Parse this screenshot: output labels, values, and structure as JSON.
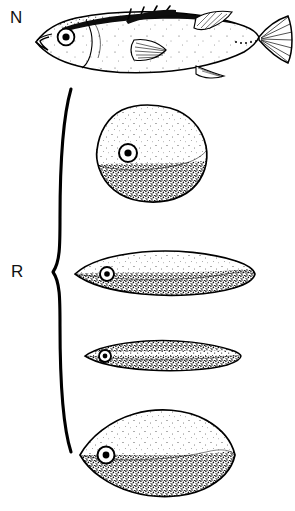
{
  "figure": {
    "background_color": "#ffffff",
    "ink_color": "#000000",
    "width": 295,
    "height": 511
  },
  "labels": {
    "normal": {
      "text": "N",
      "meaning": "normal-form",
      "x": 10,
      "y": 9
    },
    "radiated": {
      "text": "R",
      "meaning": "radiated-form-group",
      "x": 11,
      "y": 263
    }
  },
  "brace": {
    "name": "curly-brace",
    "orientation": "left-facing",
    "top_y": 88,
    "apex_y": 272,
    "bottom_y": 452,
    "x": 62
  },
  "specimens": [
    {
      "id": "normal-fish",
      "group": "N",
      "shape": "full-fish-lateral",
      "description": "intact stickleback-like fish with head, eye, dorsal spines, pectoral fin, caudal fan",
      "bbox": {
        "x": 35,
        "y": 8,
        "w": 255,
        "h": 72
      },
      "eye": {
        "cx": 66,
        "cy": 37,
        "r": 8,
        "pupil_r": 3.4
      },
      "has_fins": true,
      "stipple": "light"
    },
    {
      "id": "radiated-rhomboid",
      "group": "R",
      "shape": "rounded-rhomboid",
      "description": "deep rounded diamond body, dark stippled ventral half",
      "bbox": {
        "x": 95,
        "y": 106,
        "w": 112,
        "h": 96
      },
      "eye": {
        "cx": 128,
        "cy": 153,
        "r": 9,
        "pupil_r": 3.6
      },
      "has_fins": false,
      "stipple": "heavy-ventral"
    },
    {
      "id": "radiated-lens-long",
      "group": "R",
      "shape": "elongate-lens",
      "description": "long slender spindle body, stippled ventral band",
      "bbox": {
        "x": 74,
        "y": 251,
        "w": 182,
        "h": 43
      },
      "eye": {
        "cx": 107,
        "cy": 274,
        "r": 7,
        "pupil_r": 2.8
      },
      "has_fins": false,
      "stipple": "heavy-ventral"
    },
    {
      "id": "radiated-lens-thin",
      "group": "R",
      "shape": "thin-elongate-lens",
      "description": "very slender needle-like body, strongly stippled",
      "bbox": {
        "x": 84,
        "y": 340,
        "w": 157,
        "h": 30
      },
      "eye": {
        "cx": 105,
        "cy": 356,
        "r": 6,
        "pupil_r": 2.4
      },
      "has_fins": false,
      "stipple": "heavy-overall"
    },
    {
      "id": "radiated-oval-deep",
      "group": "R",
      "shape": "deep-oval-lens",
      "description": "broad pointed oval body, dark stippled ventral half",
      "bbox": {
        "x": 79,
        "y": 409,
        "w": 157,
        "h": 88
      },
      "eye": {
        "cx": 106,
        "cy": 455,
        "r": 8.5,
        "pupil_r": 3.4
      },
      "has_fins": false,
      "stipple": "heavy-ventral"
    }
  ]
}
